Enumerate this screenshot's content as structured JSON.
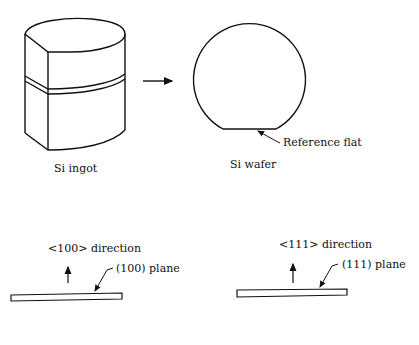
{
  "figure": {
    "ingot": {
      "label": "Si ingot"
    },
    "process_arrow": {
      "icon": "right-arrow-icon"
    },
    "wafer": {
      "label": "Si wafer",
      "flat_label": "Reference flat"
    },
    "wafer_100": {
      "direction_label": "<100> direction",
      "plane_label": "(100) plane"
    },
    "wafer_111": {
      "direction_label": "<111> direction",
      "plane_label": "(111) plane"
    }
  },
  "colors": {
    "line": "#111111",
    "background": "#ffffff"
  }
}
